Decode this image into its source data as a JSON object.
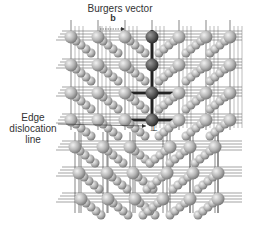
{
  "labels": {
    "burgers_vector": "Burgers vector",
    "b_symbol": "b",
    "edge_dislocation_line": [
      "Edge",
      "dislocation",
      "line"
    ],
    "dislocation_symbol": "⊥"
  },
  "colors": {
    "background": "#ffffff",
    "atom": "#b8b8b8",
    "atom_highlight": "#e8e8e8",
    "extra_half_plane_atom": "#5a5a5a",
    "bond": "#222222",
    "grid_line": "#333333"
  },
  "lattice": {
    "upper_rows_y": [
      37,
      65,
      93,
      120
    ],
    "upper_cols_x": [
      71,
      98,
      125,
      152,
      179,
      206,
      230
    ],
    "extra_half_plane_col_x": 152,
    "lower_rows": [
      {
        "y": 147,
        "x": [
          75,
          103,
          130,
          170,
          190,
          215
        ]
      },
      {
        "y": 173,
        "x": [
          79,
          107,
          133,
          167,
          193,
          218
        ]
      },
      {
        "y": 199,
        "x": [
          81,
          108,
          135,
          163,
          190,
          218
        ]
      }
    ]
  }
}
